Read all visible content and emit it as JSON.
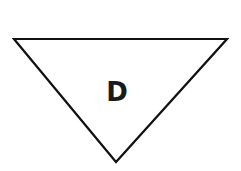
{
  "diagram": {
    "shape": "inverted-triangle",
    "label": "D",
    "stroke_color": "#111111",
    "fill_color": "#ffffff",
    "vertices": [
      [
        14,
        39
      ],
      [
        227,
        39
      ],
      [
        116,
        162
      ]
    ]
  }
}
